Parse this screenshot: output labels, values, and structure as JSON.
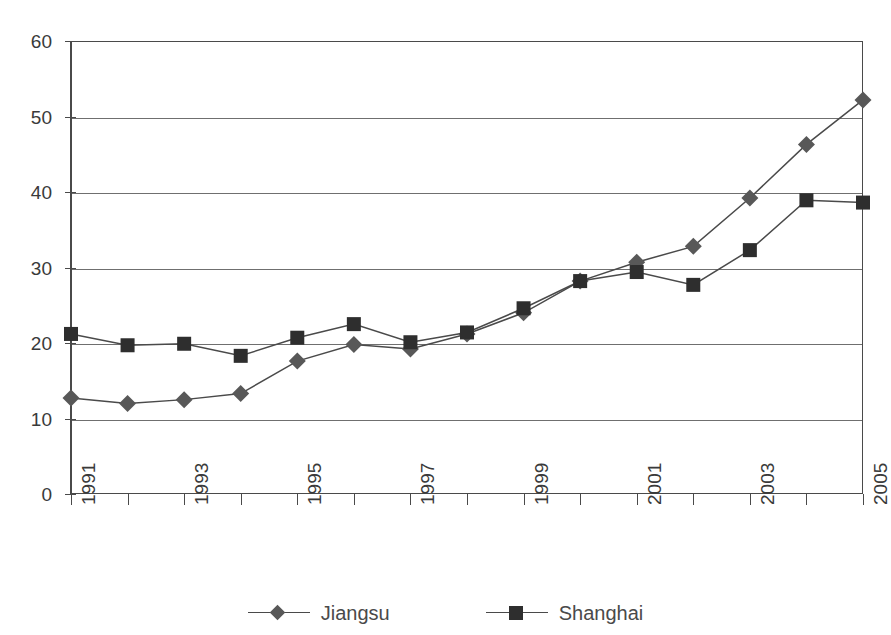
{
  "chart_data": {
    "type": "line",
    "title": "",
    "xlabel": "",
    "ylabel": "",
    "ylim": [
      0,
      60
    ],
    "yticks": [
      0,
      10,
      20,
      30,
      40,
      50,
      60
    ],
    "grid": true,
    "legend_position": "bottom",
    "x": [
      1991,
      1992,
      1993,
      1994,
      1995,
      1996,
      1997,
      1998,
      1999,
      2000,
      2001,
      2002,
      2003,
      2004,
      2005
    ],
    "xtick_labels": [
      "1991",
      "",
      "1993",
      "",
      "1995",
      "",
      "1997",
      "",
      "1999",
      "",
      "2001",
      "",
      "2003",
      "",
      "2005"
    ],
    "series": [
      {
        "name": "Jiangsu",
        "marker": "diamond",
        "color": "#585858",
        "values": [
          12.7,
          12.0,
          12.5,
          13.3,
          17.6,
          19.8,
          19.2,
          21.2,
          24.0,
          28.2,
          30.7,
          32.8,
          39.2,
          46.3,
          52.2
        ]
      },
      {
        "name": "Shanghai",
        "marker": "square",
        "color": "#2e2e2e",
        "values": [
          21.2,
          19.7,
          19.9,
          18.3,
          20.7,
          22.5,
          20.1,
          21.4,
          24.6,
          28.2,
          29.4,
          27.7,
          32.3,
          38.9,
          38.6
        ]
      }
    ]
  },
  "legend": {
    "items": [
      {
        "label": "Jiangsu"
      },
      {
        "label": "Shanghai"
      }
    ]
  }
}
